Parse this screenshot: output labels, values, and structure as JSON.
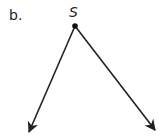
{
  "part_label": "b.",
  "diagram": {
    "type": "angle",
    "vertex": {
      "label": "S",
      "x": 75,
      "y": 26
    },
    "rays": [
      {
        "name": "left-ray",
        "from": [
          75,
          26
        ],
        "to": [
          29,
          132
        ]
      },
      {
        "name": "right-ray",
        "from": [
          75,
          26
        ],
        "to": [
          155,
          130
        ]
      }
    ],
    "stroke_color": "#222222"
  }
}
